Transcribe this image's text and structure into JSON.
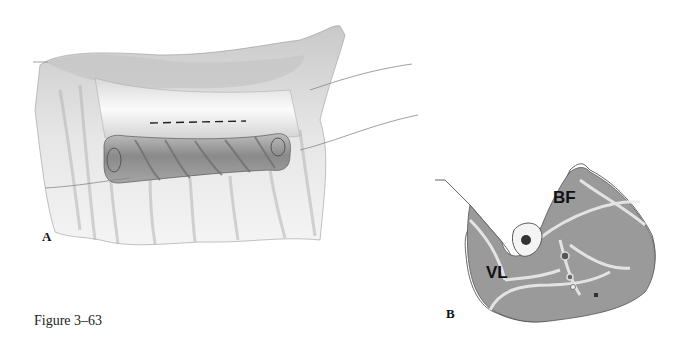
{
  "figure": {
    "caption": "Figure 3–63",
    "panels": [
      {
        "letter": "A",
        "description": "Surgical illustration: skin flap retracted with rolled tubed pedicle below; dashed incision line marked on exposed area"
      },
      {
        "letter": "B",
        "description": "Cross-section of thigh showing muscle compartments",
        "labels": [
          "BF",
          "VL"
        ]
      }
    ]
  },
  "colors": {
    "background": "#ffffff",
    "muscle_fill": "#8e8e8e",
    "fascia": "#e8e8e8",
    "outline": "#555555",
    "text": "#111111"
  }
}
